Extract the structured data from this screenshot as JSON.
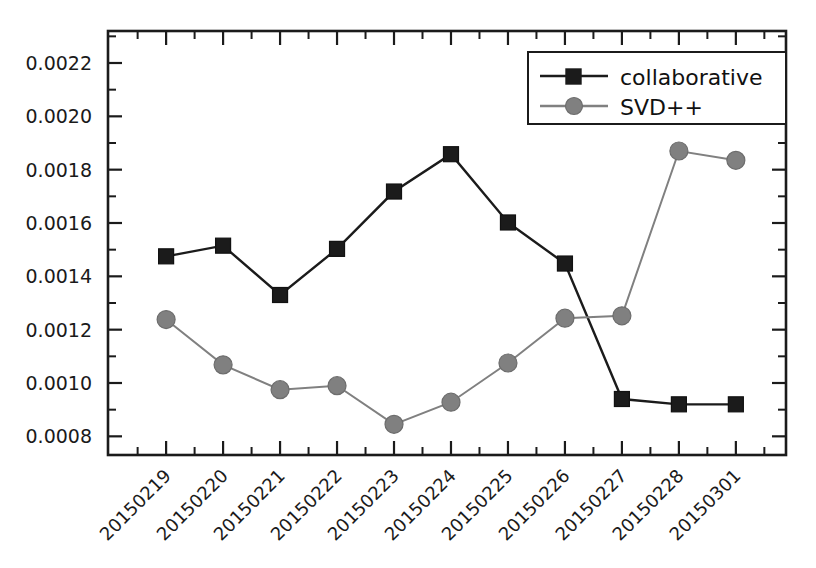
{
  "chart_data": {
    "type": "line",
    "title": "",
    "xlabel": "",
    "ylabel": "",
    "categories": [
      "20150219",
      "20150220",
      "20150221",
      "20150222",
      "20150223",
      "20150224",
      "20150225",
      "20150226",
      "20150227",
      "20150228",
      "20150301"
    ],
    "series": [
      {
        "name": "collaborative",
        "marker": "square",
        "color": "#1b1b1b",
        "values": [
          0.001475,
          0.001515,
          0.00133,
          0.001503,
          0.001718,
          0.001858,
          0.001602,
          0.001448,
          0.00094,
          0.00092,
          0.00092
        ]
      },
      {
        "name": "SVD++",
        "marker": "circle",
        "color": "#808080",
        "values": [
          0.001238,
          0.001068,
          0.000975,
          0.00099,
          0.000845,
          0.000928,
          0.001075,
          0.001243,
          0.001252,
          0.00187,
          0.001835
        ]
      }
    ],
    "ylim": [
      0.00073,
      0.00232
    ],
    "ytick_values": [
      0.0008,
      0.001,
      0.0012,
      0.0014,
      0.0016,
      0.0018,
      0.002,
      0.0022
    ],
    "ytick_labels": [
      "0.0008",
      "0.0010",
      "0.0012",
      "0.0014",
      "0.0016",
      "0.0018",
      "0.0020",
      "0.0022"
    ],
    "yminor_step": 0.0001,
    "grid": false,
    "legend_position": "top-right",
    "legend_entries": [
      "collaborative",
      "SVD++"
    ]
  },
  "axes": {
    "xtick_rotation_deg": -45
  },
  "colors": {
    "collaborative": "#1b1b1b",
    "svdpp": "#808080",
    "axis": "#1b1b1b",
    "background": "#ffffff"
  }
}
